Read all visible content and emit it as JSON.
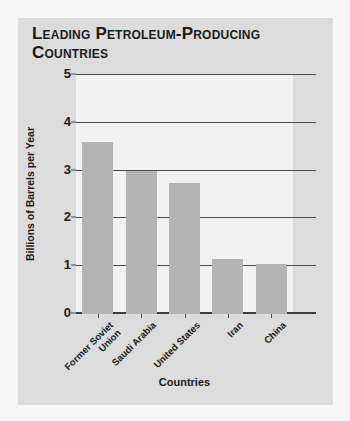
{
  "chart_data": {
    "type": "bar",
    "title": "Leading Petroleum-Producing Countries",
    "xlabel": "Countries",
    "ylabel": "Billions of Barrels per Year",
    "categories": [
      "Former Soviet Union",
      "Saudi Arabia",
      "United States",
      "Iran",
      "China"
    ],
    "category_lines": [
      [
        "Former Soviet",
        "Union"
      ],
      [
        "Saudi Arabia"
      ],
      [
        "United States"
      ],
      [
        "Iran"
      ],
      [
        "China"
      ]
    ],
    "values": [
      3.6,
      3.0,
      2.75,
      1.15,
      1.05
    ],
    "ylim": [
      0,
      5
    ],
    "yticks": [
      0,
      1,
      2,
      3,
      4,
      5
    ],
    "ytick_labels": [
      "0",
      "1",
      "2",
      "3",
      "4",
      "5"
    ],
    "grid": true,
    "legend": false,
    "bar_color": "#b4b4b4",
    "plot_background": "#f2f2f2",
    "card_background": "#dcdcdc",
    "axis_color": "#4d4d4d"
  }
}
